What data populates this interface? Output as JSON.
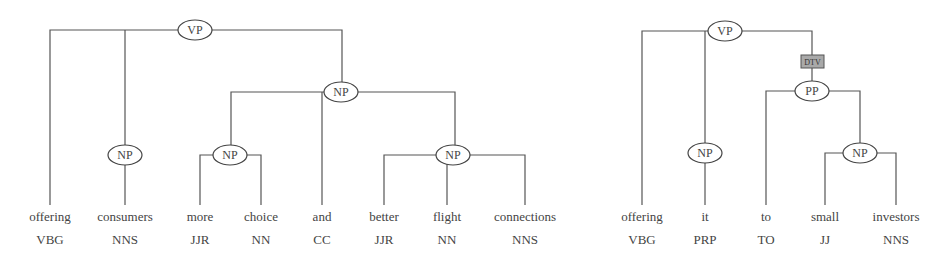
{
  "trees": [
    {
      "id": "tree1",
      "root": "VP",
      "nodes": {
        "vp": {
          "label": "VP"
        },
        "np_obj": {
          "label": "NP"
        },
        "np_consumers": {
          "label": "NP"
        },
        "np_more_choice": {
          "label": "NP"
        },
        "np_better_flight": {
          "label": "NP"
        }
      },
      "leaves": [
        {
          "word": "offering",
          "pos": "VBG"
        },
        {
          "word": "consumers",
          "pos": "NNS"
        },
        {
          "word": "more",
          "pos": "JJR"
        },
        {
          "word": "choice",
          "pos": "NN"
        },
        {
          "word": "and",
          "pos": "CC"
        },
        {
          "word": "better",
          "pos": "JJR"
        },
        {
          "word": "flight",
          "pos": "NN"
        },
        {
          "word": "connections",
          "pos": "NNS"
        }
      ]
    },
    {
      "id": "tree2",
      "root": "VP",
      "nodes": {
        "vp": {
          "label": "VP"
        },
        "dtv": {
          "label": "DTV"
        },
        "pp": {
          "label": "PP"
        },
        "np_it": {
          "label": "NP"
        },
        "np_small_investors": {
          "label": "NP"
        }
      },
      "leaves": [
        {
          "word": "offering",
          "pos": "VBG"
        },
        {
          "word": "it",
          "pos": "PRP"
        },
        {
          "word": "to",
          "pos": "TO"
        },
        {
          "word": "small",
          "pos": "JJ"
        },
        {
          "word": "investors",
          "pos": "NNS"
        }
      ]
    }
  ]
}
